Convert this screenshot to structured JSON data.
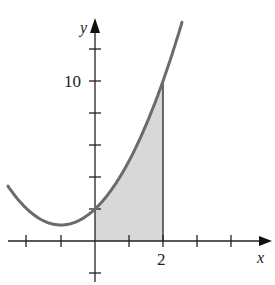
{
  "figure": {
    "function": "y = x^2 + 2x + 2",
    "x_axis_label": "x",
    "y_axis_label": "y",
    "x_tick_label": "2",
    "y_tick_label": "10",
    "shaded_region": {
      "from_x": 0,
      "to_x": 2,
      "description": "area under curve between x=0 and x=2"
    },
    "colors": {
      "curve": "#6b6b6b",
      "axis": "#222222",
      "shade": "#d9d9d9"
    }
  },
  "chart_data": {
    "type": "line",
    "title": "",
    "xlabel": "x",
    "ylabel": "y",
    "x": [
      -2.56,
      -2,
      -1.5,
      -1,
      -0.5,
      0,
      0.5,
      1,
      1.5,
      2,
      2.56
    ],
    "values": [
      3.43,
      2,
      1.25,
      1,
      1.25,
      2,
      3.25,
      5,
      6.75,
      10,
      13.67
    ],
    "x_ticks": [
      -2,
      -1,
      0,
      1,
      2,
      3,
      4
    ],
    "x_tick_labels": {
      "2": "2"
    },
    "y_ticks": [
      -2,
      2,
      4,
      6,
      8,
      10,
      12
    ],
    "y_tick_labels": {
      "10": "10"
    },
    "xlim": [
      -2.8,
      5
    ],
    "ylim": [
      -2.5,
      13.8
    ],
    "shaded_interval": [
      0,
      2
    ],
    "grid": false
  }
}
